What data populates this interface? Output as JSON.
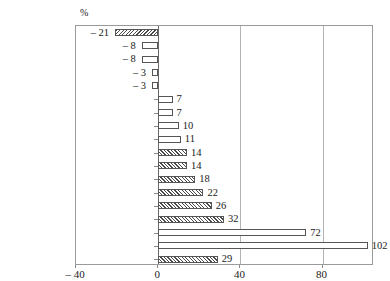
{
  "chart_data": {
    "type": "bar",
    "orientation": "horizontal",
    "title": "",
    "subtitle": "",
    "xlabel": "",
    "ylabel": "",
    "unit_label": "%",
    "xlim": [
      -40,
      105
    ],
    "xticks": [
      -40,
      0,
      40,
      80
    ],
    "xtick_labels": [
      "– 40",
      "0",
      "40",
      "80"
    ],
    "gridlines": [
      40,
      80
    ],
    "grid": true,
    "zero_line": 0,
    "legend": "none",
    "categories": [
      "Germany",
      "Austria",
      "Finland",
      "Belgium",
      "France",
      "Netherlands",
      "Slovenia",
      "Luxembourg",
      "Malta",
      "Portugal",
      "Greece",
      "Cyprus",
      "Spain",
      "Italy",
      "Ireland",
      "Slovakia",
      "Estonia",
      "GIPSIC"
    ],
    "values": [
      -21,
      -8,
      -8,
      -3,
      -3,
      7,
      7,
      10,
      11,
      14,
      14,
      18,
      22,
      26,
      32,
      72,
      102,
      29
    ],
    "value_labels": [
      "– 21",
      "– 8",
      "– 8",
      "– 3",
      "– 3",
      "7",
      "7",
      "10",
      "11",
      "14",
      "14",
      "18",
      "22",
      "26",
      "32",
      "72",
      "102",
      "29"
    ],
    "bar_styles": [
      "hatched",
      "plain",
      "plain",
      "plain",
      "plain",
      "plain",
      "plain",
      "plain",
      "plain",
      "hatched",
      "hatched",
      "hatched",
      "hatched",
      "hatched",
      "hatched",
      "plain",
      "plain",
      "hatched"
    ],
    "colors": {
      "bar_outline": "#555555",
      "bar_fill": "#ffffff",
      "hatch": "#4a4a4a",
      "gridline": "#b4b4b4",
      "axis": "#6a6a6a",
      "frame": "#9a9a9a",
      "text": "#1a1a1a",
      "background": "#ffffff"
    }
  }
}
